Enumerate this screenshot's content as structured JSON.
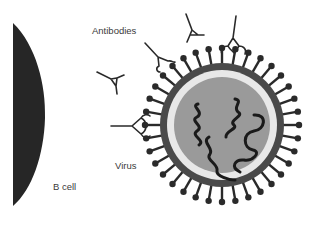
{
  "diagram": {
    "labels": {
      "antibodies": "Antibodies",
      "virus": "Virus",
      "b_cell": "B cell"
    },
    "colors": {
      "b_cell_fill": "#262626",
      "virus_outer_ring": "#4a4a4a",
      "virus_inner_ring": "#e8e8e8",
      "virus_core": "#9a9a9a",
      "rna_strands": "#1a1a1a",
      "spikes": "#2a2a2a",
      "antibody_stroke": "#2a2a2a",
      "label_text": "#3a3a3a"
    },
    "virus": {
      "cx": 222,
      "cy": 125,
      "outer_radius": 62,
      "spike_count": 36
    }
  }
}
